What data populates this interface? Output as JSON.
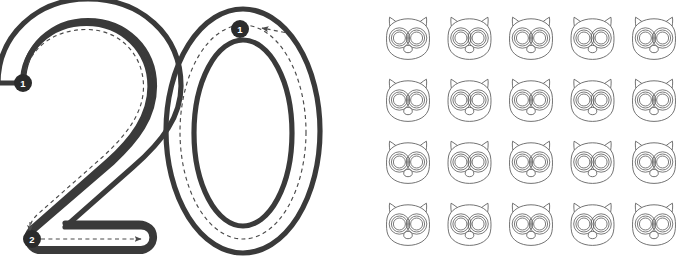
{
  "worksheet": {
    "title": "Number 20 Tracing Worksheet",
    "number_word": "twenty",
    "number_value": "20",
    "canvas": {
      "width": 687,
      "height": 263,
      "background": "#ffffff"
    }
  },
  "colors": {
    "digit_stroke": "#3a3a3a",
    "guide_dash": "#4a4a4a",
    "marker_fill": "#2b2b2b",
    "marker_text": "#ffffff",
    "owl_outline": "#5a5a5a",
    "owl_pupil": "#111111",
    "page_background": "#ffffff"
  },
  "digits": [
    {
      "glyph": "2",
      "name": "digit-two",
      "stroke_count": 2,
      "strokes": [
        {
          "order_label": "1",
          "marker_x": 23,
          "marker_y": 83,
          "direction": "clockwise-curve-down",
          "arrow": false
        },
        {
          "order_label": "2",
          "marker_x": 32,
          "marker_y": 239,
          "direction": "left-to-right",
          "arrow": true,
          "arrow_x": 146,
          "arrow_y": 239
        }
      ]
    },
    {
      "glyph": "0",
      "name": "digit-zero",
      "stroke_count": 1,
      "strokes": [
        {
          "order_label": "1",
          "marker_x": 240,
          "marker_y": 29,
          "direction": "counter-clockwise",
          "arrow": true,
          "arrow_x": 262,
          "arrow_y": 30
        }
      ]
    }
  ],
  "counting_grid": {
    "name": "owl-counting-grid",
    "item_icon": "owl-face-icon",
    "item_label": "owl",
    "rows": 4,
    "columns": 5,
    "total_count": 20,
    "origin_x": 382,
    "origin_y": 12,
    "cell_width": 52,
    "cell_height": 52,
    "column_step": 61.5,
    "row_step": 62,
    "items": [
      {
        "index": 1,
        "row": 1,
        "col": 1
      },
      {
        "index": 2,
        "row": 1,
        "col": 2
      },
      {
        "index": 3,
        "row": 1,
        "col": 3
      },
      {
        "index": 4,
        "row": 1,
        "col": 4
      },
      {
        "index": 5,
        "row": 1,
        "col": 5
      },
      {
        "index": 6,
        "row": 2,
        "col": 1
      },
      {
        "index": 7,
        "row": 2,
        "col": 2
      },
      {
        "index": 8,
        "row": 2,
        "col": 3
      },
      {
        "index": 9,
        "row": 2,
        "col": 4
      },
      {
        "index": 10,
        "row": 2,
        "col": 5
      },
      {
        "index": 11,
        "row": 3,
        "col": 1
      },
      {
        "index": 12,
        "row": 3,
        "col": 2
      },
      {
        "index": 13,
        "row": 3,
        "col": 3
      },
      {
        "index": 14,
        "row": 3,
        "col": 4
      },
      {
        "index": 15,
        "row": 3,
        "col": 5
      },
      {
        "index": 16,
        "row": 4,
        "col": 1
      },
      {
        "index": 17,
        "row": 4,
        "col": 2
      },
      {
        "index": 18,
        "row": 4,
        "col": 3
      },
      {
        "index": 19,
        "row": 4,
        "col": 4
      },
      {
        "index": 20,
        "row": 4,
        "col": 5
      }
    ]
  },
  "owl_face": {
    "parts": [
      "left-ear",
      "right-ear",
      "head",
      "left-eye",
      "right-eye",
      "left-pupil",
      "right-pupil",
      "beak"
    ],
    "eye_rings": 3
  }
}
